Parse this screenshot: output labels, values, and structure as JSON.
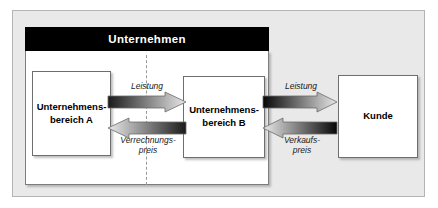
{
  "diagram": {
    "title": "Unternehmen",
    "boxes": {
      "division_a": {
        "line1": "Unternehmens-",
        "line2": "bereich A"
      },
      "division_b": {
        "line1": "Unternehmens-",
        "line2": "bereich B"
      },
      "customer": {
        "line1": "Kunde",
        "line2": ""
      }
    },
    "flows": {
      "internal_service": {
        "line1": "Leistung",
        "line2": ""
      },
      "transfer_price": {
        "line1": "Verrechnungs-",
        "line2": "preis"
      },
      "external_service": {
        "line1": "Leistung",
        "line2": ""
      },
      "sales_price": {
        "line1": "Verkaufs-",
        "line2": "preis"
      }
    },
    "colors": {
      "panel_background": "#e9e9e9",
      "header_background": "#000000",
      "header_text": "#ffffff",
      "box_background": "#ffffff",
      "box_border": "#6e6e6e",
      "arrow_dark": "#1a1a1a",
      "arrow_light": "#e2e2e2",
      "divider": "#9a9a9a"
    }
  }
}
